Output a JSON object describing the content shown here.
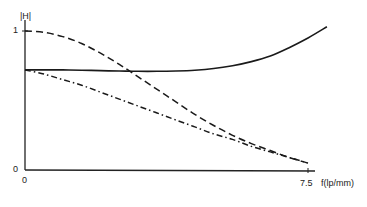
{
  "chart_data": {
    "type": "line",
    "title": "",
    "xlabel": "f(lp/mm)",
    "ylabel": "|H|",
    "x_ticks": [
      "0",
      "7.5"
    ],
    "y_ticks": [
      "0",
      "1"
    ],
    "xlim": [
      0,
      8.2
    ],
    "ylim": [
      0,
      1.05
    ],
    "grid": false,
    "legend": null,
    "x": [
      0,
      0.5,
      1,
      1.5,
      2,
      2.5,
      3,
      3.5,
      4,
      4.5,
      5,
      5.5,
      6,
      6.5,
      7,
      7.5,
      8
    ],
    "series": [
      {
        "name": "solid",
        "style": "solid",
        "values": [
          0.72,
          0.72,
          0.72,
          0.718,
          0.715,
          0.712,
          0.71,
          0.71,
          0.712,
          0.718,
          0.73,
          0.75,
          0.78,
          0.82,
          0.88,
          0.95,
          1.03
        ]
      },
      {
        "name": "dashed",
        "style": "dashed",
        "values": [
          1.0,
          0.99,
          0.96,
          0.91,
          0.84,
          0.76,
          0.67,
          0.58,
          0.49,
          0.4,
          0.32,
          0.25,
          0.19,
          0.14,
          0.09,
          0.05,
          null
        ]
      },
      {
        "name": "dash-dot",
        "style": "dash-dot",
        "values": [
          0.72,
          0.69,
          0.65,
          0.61,
          0.56,
          0.51,
          0.46,
          0.41,
          0.36,
          0.31,
          0.26,
          0.22,
          0.17,
          0.13,
          0.09,
          0.05,
          null
        ]
      }
    ]
  },
  "labels": {
    "ylabel": "|H|",
    "xlabel": "f(lp/mm)",
    "y_tick_1": "1",
    "y_tick_0": "0",
    "x_tick_0": "0",
    "x_tick_75": "7.5"
  }
}
